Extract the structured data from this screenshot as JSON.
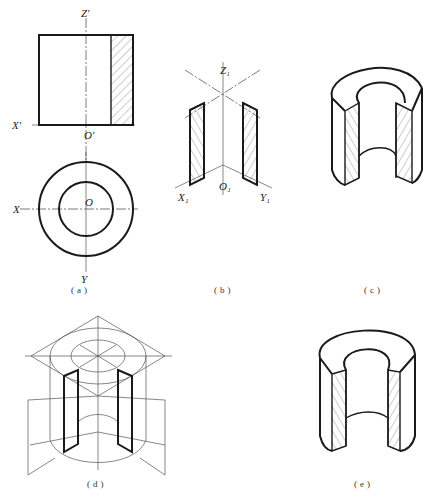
{
  "figure": {
    "panels": [
      {
        "id": "a",
        "caption": "(a)",
        "labels": {
          "z_prime": "Z′",
          "x_prime": "X′",
          "o_prime": "O′",
          "x": "X",
          "o": "O",
          "y": "Y"
        }
      },
      {
        "id": "b",
        "caption": "(b)",
        "labels": {
          "z1": "Z₁",
          "x1": "X₁",
          "o1": "O₁",
          "y1": "Y₁"
        }
      },
      {
        "id": "c",
        "caption": "(c)"
      },
      {
        "id": "d",
        "caption": "(d)"
      },
      {
        "id": "e",
        "caption": "(e)"
      }
    ]
  }
}
